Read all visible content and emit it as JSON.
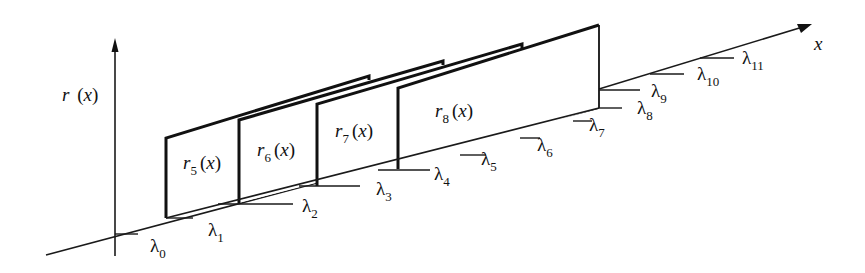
{
  "diagram": {
    "axes": {
      "y_label": {
        "main": "r",
        "paren": "(x)"
      },
      "x_label": "x"
    },
    "panels": [
      {
        "id": "r5",
        "base": "r",
        "sub": "5",
        "arg": "(x)"
      },
      {
        "id": "r6",
        "base": "r",
        "sub": "6",
        "arg": "(x)"
      },
      {
        "id": "r7",
        "base": "r",
        "sub": "7",
        "arg": "(x)"
      },
      {
        "id": "r8",
        "base": "r",
        "sub": "8",
        "arg": "(x)"
      }
    ],
    "thresholds": [
      {
        "sym": "λ",
        "sub": "0"
      },
      {
        "sym": "λ",
        "sub": "1"
      },
      {
        "sym": "λ",
        "sub": "2"
      },
      {
        "sym": "λ",
        "sub": "3"
      },
      {
        "sym": "λ",
        "sub": "4"
      },
      {
        "sym": "λ",
        "sub": "5"
      },
      {
        "sym": "λ",
        "sub": "6"
      },
      {
        "sym": "λ",
        "sub": "7"
      },
      {
        "sym": "λ",
        "sub": "8"
      },
      {
        "sym": "λ",
        "sub": "9"
      },
      {
        "sym": "λ",
        "sub": "10"
      },
      {
        "sym": "λ",
        "sub": "11"
      }
    ],
    "colors": {
      "ink": "#111111",
      "background": "#ffffff"
    }
  }
}
